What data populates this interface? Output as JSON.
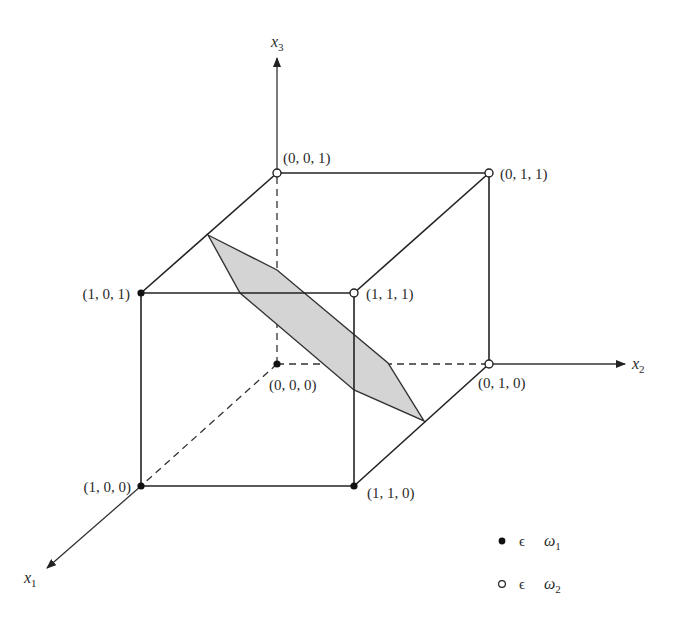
{
  "figure": {
    "type": "3d-unit-cube-with-separating-plane",
    "axes": {
      "x1": {
        "label": "x",
        "sub": "1"
      },
      "x2": {
        "label": "x",
        "sub": "2"
      },
      "x3": {
        "label": "x",
        "sub": "3"
      }
    },
    "vertices": [
      {
        "id": "v001",
        "label": "(0, 0, 1)",
        "class": "omega2",
        "filled": false
      },
      {
        "id": "v011",
        "label": "(0, 1, 1)",
        "class": "omega2",
        "filled": false
      },
      {
        "id": "v101",
        "label": "(1, 0, 1)",
        "class": "omega1",
        "filled": true
      },
      {
        "id": "v111",
        "label": "(1, 1, 1)",
        "class": "omega2",
        "filled": false
      },
      {
        "id": "v000",
        "label": "(0, 0, 0)",
        "class": "omega1",
        "filled": true
      },
      {
        "id": "v010",
        "label": "(0, 1, 0)",
        "class": "omega2",
        "filled": false
      },
      {
        "id": "v100",
        "label": "(1, 0, 0)",
        "class": "omega1",
        "filled": true
      },
      {
        "id": "v110",
        "label": "(1, 1, 0)",
        "class": "omega1",
        "filled": true
      }
    ],
    "plane": {
      "description": "shaded decision plane separating classes",
      "fill": "#d4d4d4"
    },
    "legend": [
      {
        "marker": "filled-dot",
        "symbol": "ϵ",
        "class_label": "ω",
        "class_sub": "1"
      },
      {
        "marker": "open-dot",
        "symbol": "ϵ",
        "class_label": "ω",
        "class_sub": "2"
      }
    ],
    "colors": {
      "line": "#222222",
      "plane": "#d4d4d4",
      "background": "#ffffff"
    }
  }
}
